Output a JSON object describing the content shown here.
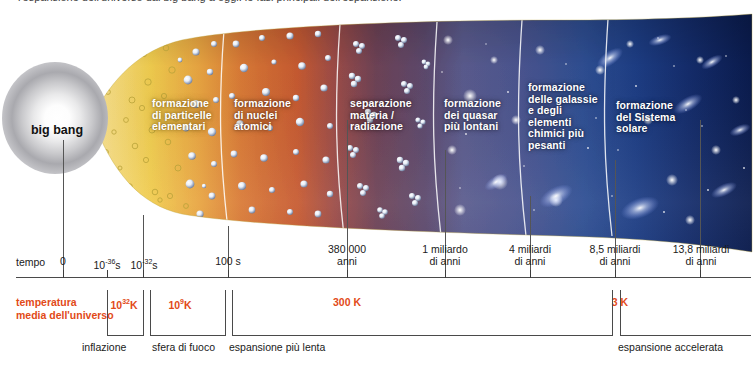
{
  "figure": {
    "truncated_top_caption": "l'espansione dell'universo dal big bang a oggi: le fasi principali dell'espansione.",
    "big_bang_label": "big\nbang"
  },
  "colors": {
    "band_yellow": "#f2d255",
    "band_orange": "#d8692f",
    "band_maroon": "#6e4357",
    "band_violet": "#5b5c8e",
    "band_blue": "#2f4f93",
    "band_deepblue": "#17306e",
    "band_navy": "#0d1f52",
    "temperature_text": "#e24a18",
    "axis": "#4a4a4a",
    "label_text": "#1a1a1a"
  },
  "bands": [
    {
      "id": "particelle",
      "label": "formazione\ndi particelle\nelementari"
    },
    {
      "id": "nuclei",
      "label": "formazione\ndi nuclei\natomici"
    },
    {
      "id": "separazione",
      "label": "separazione\nmateria /\nradiazione"
    },
    {
      "id": "quasar",
      "label": "formazione\ndei quasar\npiù lontani"
    },
    {
      "id": "galassie",
      "label": "formazione\ndelle galassie\ne degli\nelementi\nchimici più\npesanti"
    },
    {
      "id": "sistema",
      "label": "formazione\ndel Sistema\nsolare"
    }
  ],
  "time_axis": {
    "title": "tempo",
    "ticks": [
      {
        "label": "0",
        "x": 63,
        "sup": ""
      },
      {
        "label": "10|s",
        "x": 107,
        "sup": "-36"
      },
      {
        "label": "10|s",
        "x": 143,
        "sup": "-32"
      },
      {
        "label": "100 s",
        "x": 228,
        "sup": ""
      },
      {
        "label": "380 000\nanni",
        "x": 347,
        "sup": ""
      },
      {
        "label": "1 miliardo\ndi anni",
        "x": 445,
        "sup": ""
      },
      {
        "label": "4 miliardi\ndi anni",
        "x": 530,
        "sup": ""
      },
      {
        "label": "8,5 miliardi\ndi anni",
        "x": 615,
        "sup": ""
      },
      {
        "label": "13,8 miliardi\ndi anni",
        "x": 700,
        "sup": ""
      }
    ]
  },
  "temperature_axis": {
    "title": "temperatura\nmedia dell'universo",
    "values": [
      {
        "label": "10|K",
        "sup": "32",
        "x": 124
      },
      {
        "label": "10|K",
        "sup": "9",
        "x": 180
      },
      {
        "label": "300 K",
        "sup": "",
        "x": 347
      },
      {
        "label": "3 K",
        "sup": "",
        "x": 620
      }
    ]
  },
  "phases": [
    {
      "label": "inflazione",
      "x0": 107,
      "x1": 143,
      "text_x": 85
    },
    {
      "label": "sfera di fuoco",
      "x0": 150,
      "x1": 225,
      "text_x": 152
    },
    {
      "label": "espansione più lenta",
      "x0": 232,
      "x1": 612,
      "text_x": 229
    },
    {
      "label": "espansione accelerata",
      "x0": 620,
      "x1": 750,
      "text_x": 618
    }
  ]
}
